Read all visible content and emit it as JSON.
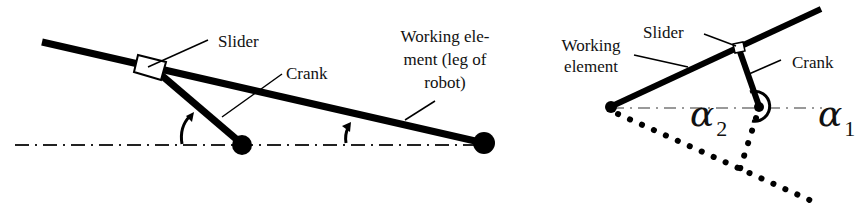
{
  "left_diagram": {
    "labels": {
      "slider": "Slider",
      "crank": "Crank",
      "working_element_line1": "Working ele-",
      "working_element_line2": "ment (leg of",
      "working_element_line3": "robot)"
    }
  },
  "right_diagram": {
    "labels": {
      "slider": "Slider",
      "crank": "Crank",
      "working_element_line1": "Working",
      "working_element_line2": "element",
      "alpha1_symbol": "α",
      "alpha1_sub": "1",
      "alpha2_symbol": "α",
      "alpha2_sub": "2"
    }
  },
  "colors": {
    "ink": "#000000",
    "centerline": "#999999",
    "background": "#ffffff"
  }
}
